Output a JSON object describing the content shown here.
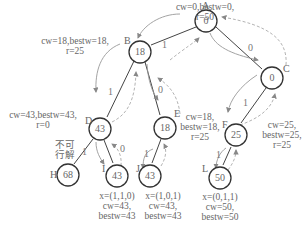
{
  "nodes": {
    "A": {
      "letter": "A",
      "value": "0",
      "info": [
        "cw=0,bestw=0,",
        "r=50"
      ]
    },
    "B": {
      "letter": "B",
      "value": "18",
      "info": [
        "cw=18,bestw=18,",
        "r=25"
      ]
    },
    "C": {
      "letter": "C",
      "value": "0"
    },
    "D": {
      "letter": "D",
      "value": "43",
      "info": [
        "cw=43,bestw=43,",
        "r=0"
      ],
      "note": [
        "不可",
        "行解"
      ]
    },
    "E": {
      "letter": "E",
      "value": "18",
      "info": [
        "cw=18,",
        "bestw=18,",
        "r=25"
      ]
    },
    "F": {
      "letter": "F",
      "value": "25",
      "info_left": [
        "cw=18,",
        "bestw=18,",
        "r=25"
      ],
      "info_right": [
        "cw=25,",
        "bestw=25,",
        "r=25"
      ]
    },
    "H": {
      "letter": "H",
      "value": "68"
    },
    "I": {
      "letter": "I",
      "value": "43",
      "info": [
        "x=(1,1,0)",
        "cw=43,",
        "bestw=43"
      ]
    },
    "J": {
      "letter": "J",
      "value": "43",
      "info": [
        "x=(1,0,1)",
        "cw=43,",
        "bestw=43"
      ]
    },
    "L": {
      "letter": "L",
      "value": "50",
      "info": [
        "x=(0,1,1)",
        "cw=50,",
        "bestw=50"
      ]
    }
  },
  "edges": {
    "AB": "1",
    "AC": "0",
    "BD": "1",
    "BE": "0",
    "CF": "1",
    "DH": "1",
    "DI": "0",
    "EJ": "1",
    "FL": "1"
  },
  "colors": {
    "line": "#333333",
    "arrow": "#888888",
    "text": "#666666"
  }
}
